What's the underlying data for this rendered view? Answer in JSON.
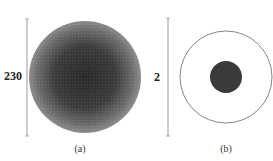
{
  "panels": [
    {
      "id": "a",
      "caption": "(a)",
      "scale_label": "230",
      "description": "Large circle with dense concentric ring pattern, darker at center",
      "colors": {
        "center": "#2e2e2e",
        "edge": "#8a8a8a",
        "scale_bar": "#9a9a9a"
      }
    },
    {
      "id": "b",
      "caption": "(b)",
      "scale_label": "2",
      "description": "Thin outlined circle with small dark filled disk at center",
      "colors": {
        "outline": "#666666",
        "disk": "#3a3a3a",
        "scale_bar": "#9a9a9a"
      }
    }
  ]
}
